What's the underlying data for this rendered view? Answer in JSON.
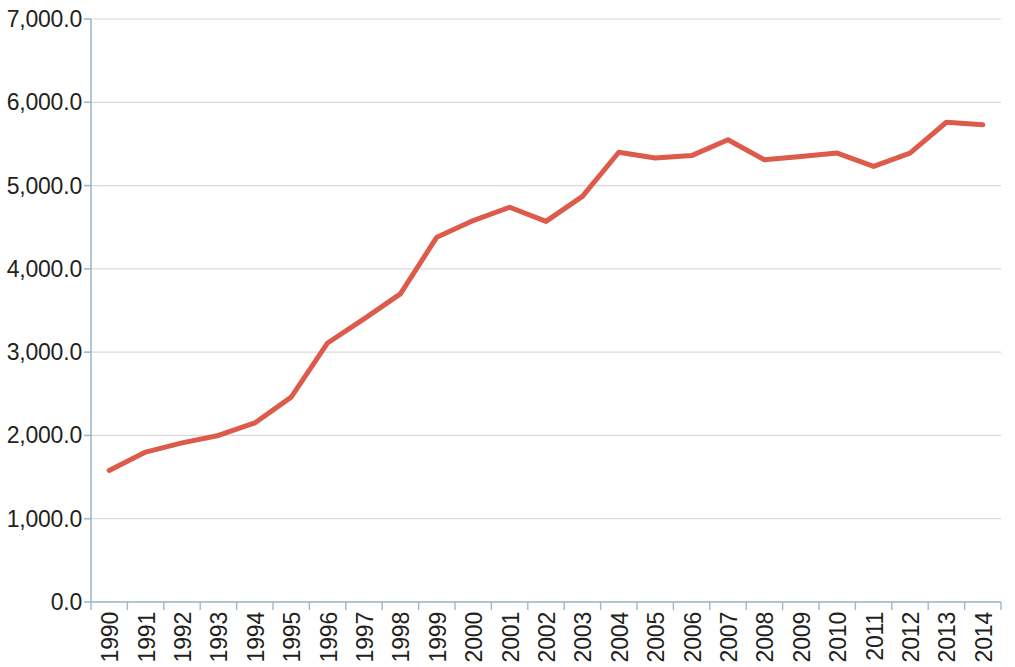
{
  "chart_data": {
    "type": "line",
    "title": "",
    "subtitle": "",
    "xlabel": "",
    "ylabel": "",
    "grid": true,
    "legend": false,
    "legend_position": "none",
    "line_color": "#DD5B4A",
    "line_width": 5,
    "background_color": "#FFFFFF",
    "gridline_color": "#D9D9D9",
    "axis_color": "#9FB8C8",
    "tick_label_color": "#231F20",
    "ylim": [
      0,
      7000
    ],
    "ytick_step": 1000,
    "ytick_labels": [
      "0.0",
      "1,000.0",
      "2,000.0",
      "3,000.0",
      "4,000.0",
      "5,000.0",
      "6,000.0",
      "7,000.0"
    ],
    "ytick_values": [
      0,
      1000,
      2000,
      3000,
      4000,
      5000,
      6000,
      7000
    ],
    "categories": [
      "1990",
      "1991",
      "1992",
      "1993",
      "1994",
      "1995",
      "1996",
      "1997",
      "1998",
      "1999",
      "2000",
      "2001",
      "2002",
      "2003",
      "2004",
      "2005",
      "2006",
      "2007",
      "2008",
      "2009",
      "2010",
      "2011",
      "2012",
      "2013",
      "2014"
    ],
    "x": [
      1990,
      1991,
      1992,
      1993,
      1994,
      1995,
      1996,
      1997,
      1998,
      1999,
      2000,
      2001,
      2002,
      2003,
      2004,
      2005,
      2006,
      2007,
      2008,
      2009,
      2010,
      2011,
      2012,
      2013,
      2014
    ],
    "values": [
      1580,
      1800,
      1910,
      2000,
      2150,
      2460,
      3110,
      3400,
      3700,
      4380,
      4580,
      4740,
      4570,
      4870,
      5400,
      5330,
      5360,
      5550,
      5310,
      5350,
      5390,
      5230,
      5390,
      5760,
      5730
    ],
    "series": [
      {
        "name": "Series 1",
        "color": "#DD5B4A",
        "values": [
          1580,
          1800,
          1910,
          2000,
          2150,
          2460,
          3110,
          3400,
          3700,
          4380,
          4580,
          4740,
          4570,
          4870,
          5400,
          5330,
          5360,
          5550,
          5310,
          5350,
          5390,
          5230,
          5390,
          5760,
          5730
        ]
      }
    ],
    "annotations": []
  }
}
